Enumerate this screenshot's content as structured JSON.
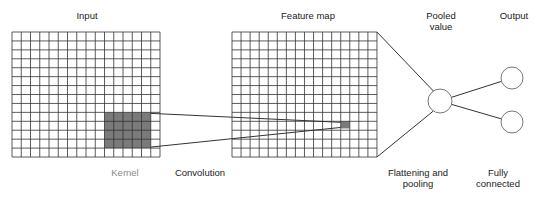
{
  "labels": {
    "input": "Input",
    "feature_map": "Feature map",
    "pooled_value_line1": "Pooled",
    "pooled_value_line2": "value",
    "output": "Output",
    "kernel": "Kernel",
    "convolution": "Convolution",
    "flattening_line1": "Flattening and",
    "flattening_line2": "pooling",
    "fully_connected_line1": "Fully",
    "fully_connected_line2": "connected"
  },
  "input_grid": {
    "x": 12,
    "y": 32,
    "cols": 16,
    "rows": 14,
    "cell_w": 9.25,
    "cell_h": 8.93
  },
  "kernel": {
    "col": 10,
    "row": 9,
    "cols": 5,
    "rows": 4,
    "color": "#7a7a7a"
  },
  "feature_map_grid": {
    "x": 232,
    "y": 32,
    "cols": 16,
    "rows": 14,
    "cell_w": 9.06,
    "cell_h": 8.93
  },
  "feature_cell": {
    "col": 12,
    "row": 10,
    "color": "#7a7a7a"
  },
  "pooled_node": {
    "cx": 440,
    "cy": 101,
    "r": 12
  },
  "output_nodes": [
    {
      "cx": 512,
      "cy": 78,
      "r": 11
    },
    {
      "cx": 512,
      "cy": 122,
      "r": 11
    }
  ],
  "colors": {
    "grid": "#333333",
    "line": "#333333",
    "shade": "#7a7a7a",
    "circle": "#777777"
  }
}
